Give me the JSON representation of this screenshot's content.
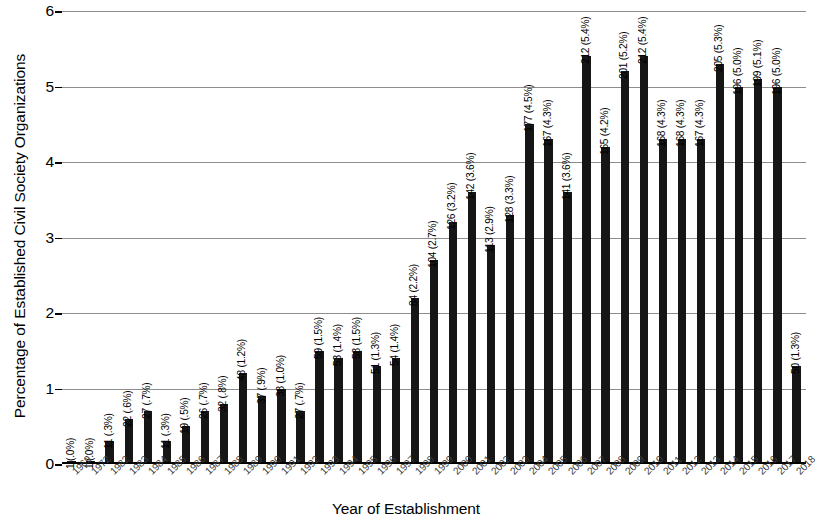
{
  "chart_data": {
    "type": "bar",
    "title": "",
    "xlabel": "Year of Establishment",
    "ylabel": "Percentage of Established Civil Society Organizations",
    "ylim": [
      0,
      6
    ],
    "yticks": [
      "0",
      "1",
      "2",
      "3",
      "4",
      "5",
      "6"
    ],
    "grid": true,
    "legend": "none",
    "bar_color": "#161616",
    "categories": [
      "1969",
      "1972",
      "1982",
      "1983",
      "1984",
      "1985",
      "1986",
      "1987",
      "1988",
      "1989",
      "1990",
      "1991",
      "1992",
      "1993",
      "1994",
      "1995",
      "1996",
      "1997",
      "1998",
      "1999",
      "2000",
      "2001",
      "2002",
      "2003",
      "2004",
      "2005",
      "2006",
      "2007",
      "2008",
      "2009",
      "2010",
      "2011",
      "2012",
      "2013",
      "2014",
      "2015",
      "2016",
      "2017",
      "2018"
    ],
    "values": [
      0.0,
      0.0,
      0.3,
      0.6,
      0.7,
      0.3,
      0.5,
      0.7,
      0.8,
      1.2,
      0.9,
      1.0,
      0.7,
      1.5,
      1.4,
      1.5,
      1.3,
      1.4,
      2.2,
      2.7,
      3.2,
      3.6,
      2.9,
      3.3,
      4.5,
      4.3,
      3.6,
      5.4,
      4.2,
      5.2,
      5.4,
      4.3,
      4.3,
      4.3,
      5.3,
      5.0,
      5.1,
      5.0,
      1.3
    ],
    "counts": [
      1,
      1,
      11,
      22,
      27,
      11,
      19,
      26,
      32,
      48,
      37,
      38,
      27,
      59,
      53,
      58,
      51,
      54,
      84,
      104,
      126,
      142,
      113,
      128,
      177,
      167,
      141,
      212,
      165,
      201,
      212,
      168,
      168,
      167,
      205,
      196,
      199,
      196,
      50
    ],
    "data_labels": [
      "1 (.0%)",
      "1 (.0%)",
      "11 (.3%)",
      "22 (.6%)",
      "27 (.7%)",
      "11 (.3%)",
      "19 (.5%)",
      "26 (.7%)",
      "32 (.8%)",
      "48 (1.2%)",
      "37 (.9%)",
      "38 (1.0%)",
      "27 (.7%)",
      "59 (1.5%)",
      "53 (1.4%)",
      "58 (1.5%)",
      "51 (1.3%)",
      "54 (1.4%)",
      "84 (2.2%)",
      "104 (2.7%)",
      "126 (3.2%)",
      "142 (3.6%)",
      "113 (2.9%)",
      "128 (3.3%)",
      "177 (4.5%)",
      "167 (4.3%)",
      "141 (3.6%)",
      "212 (5.4%)",
      "165 (4.2%)",
      "201 (5.2%)",
      "212 (5.4%)",
      "168 (4.3%)",
      "168 (4.3%)",
      "167 (4.3%)",
      "205 (5.3%)",
      "196 (5.0%)",
      "199 (5.1%)",
      "196 (5.0%)",
      "50 (1.3%)"
    ]
  }
}
